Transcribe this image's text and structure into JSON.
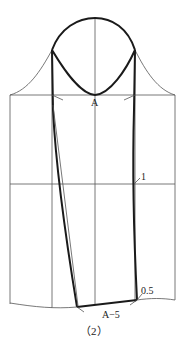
{
  "diagram": {
    "type": "sleeve-pattern-draft",
    "labels": {
      "point_a": "A",
      "offset_1": "1",
      "offset_05": "0.5",
      "hem_width": "A−5",
      "caption": "（2）"
    },
    "colors": {
      "line": "#555555",
      "bold_line": "#1a1a1a",
      "background": "#ffffff"
    }
  }
}
